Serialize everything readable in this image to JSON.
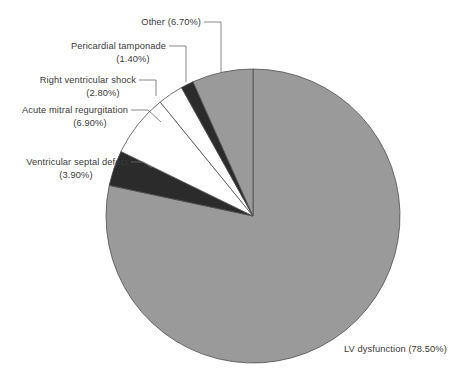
{
  "chart_data": {
    "type": "pie",
    "title": "",
    "subtitle": "",
    "xlabel": "",
    "ylabel": "",
    "legend_position": "none",
    "grid": false,
    "units": "percent",
    "start_angle_deg": 90,
    "direction": "counterclockwise",
    "categories": [
      "Other",
      "Pericardial tamponade",
      "Right ventricular shock",
      "Acute mitral regurgitation",
      "Ventricular septal defect",
      "LV dysfunction"
    ],
    "values": [
      6.7,
      1.4,
      2.8,
      6.9,
      3.9,
      78.5
    ],
    "colors": [
      "#9a9a9a",
      "#2b2b2b",
      "#ffffff",
      "#ffffff",
      "#2b2b2b",
      "#9a9a9a"
    ],
    "slices": [
      {
        "id": "other",
        "label": "Other",
        "value": 6.7,
        "value_text": "(6.70%)",
        "full_label": "Other (6.70%)",
        "color": "#9a9a9a",
        "label_lines": [
          "Other (6.70%)"
        ]
      },
      {
        "id": "pericardial-tamponade",
        "label": "Pericardial tamponade",
        "value": 1.4,
        "value_text": "(1.40%)",
        "full_label": "Pericardial tamponade (1.40%)",
        "color": "#2b2b2b",
        "label_lines": [
          "Pericardial tamponade",
          "(1.40%)"
        ]
      },
      {
        "id": "right-ventricular-shock",
        "label": "Right ventricular shock",
        "value": 2.8,
        "value_text": "(2.80%)",
        "full_label": "Right ventricular shock (2.80%)",
        "color": "#ffffff",
        "label_lines": [
          "Right ventricular shock",
          "(2.80%)"
        ]
      },
      {
        "id": "acute-mitral-regurgitation",
        "label": "Acute mitral regurgitation",
        "value": 6.9,
        "value_text": "(6.90%)",
        "full_label": "Acute mitral regurgitation (6.90%)",
        "color": "#ffffff",
        "label_lines": [
          "Acute mitral regurgitation",
          "(6.90%)"
        ]
      },
      {
        "id": "ventricular-septal-defect",
        "label": "Ventricular septal defect",
        "value": 3.9,
        "value_text": "(3.90%)",
        "full_label": "Ventricular septal defect (3.90%)",
        "color": "#2b2b2b",
        "label_lines": [
          "Ventricular septal defect",
          "(3.90%)"
        ]
      },
      {
        "id": "lv-dysfunction",
        "label": "LV dysfunction",
        "value": 78.5,
        "value_text": "(78.50%)",
        "full_label": "LV dysfunction (78.50%)",
        "color": "#9a9a9a",
        "label_lines": [
          "LV dysfunction (78.50%)"
        ]
      }
    ],
    "palette": {
      "gray": "#9a9a9a",
      "dark": "#2b2b2b",
      "white": "#ffffff",
      "outline": "#4e4e4e",
      "leader": "#6b6b6b",
      "text": "#3a3a3a",
      "background": "#ffffff"
    }
  },
  "labels": {
    "other": "Other (6.70%)",
    "pericardial_tamponade_name": "Pericardial tamponade",
    "pericardial_tamponade_value": "(1.40%)",
    "right_ventricular_shock_name": "Right ventricular shock",
    "right_ventricular_shock_value": "(2.80%)",
    "acute_mitral_regurgitation_name": "Acute mitral regurgitation",
    "acute_mitral_regurgitation_value": "(6.90%)",
    "ventricular_septal_defect_name": "Ventricular septal defect",
    "ventricular_septal_defect_value": "(3.90%)",
    "lv_dysfunction": "LV dysfunction (78.50%)"
  }
}
